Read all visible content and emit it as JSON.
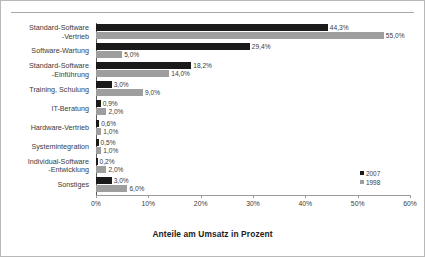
{
  "chart_data": {
    "type": "bar",
    "orientation": "horizontal",
    "title": "",
    "xlabel": "Anteile am Umsatz in Prozent",
    "ylabel": "",
    "xlim": [
      0,
      60
    ],
    "xticks": [
      "0%",
      "10%",
      "20%",
      "30%",
      "40%",
      "50%",
      "60%"
    ],
    "xtick_values": [
      0,
      10,
      20,
      30,
      40,
      50,
      60
    ],
    "grid": false,
    "legend_position": "bottom-right",
    "categories": [
      "Standard-Software\n-Vertrieb",
      "Software-Wartung",
      "Standard-Software\n-Einführung",
      "Training, Schulung",
      "IT-Beratung",
      "Hardware-Vertrieb",
      "Systemintegration",
      "Individual-Software\n-Entwicklung",
      "Sonstiges"
    ],
    "series": [
      {
        "name": "2007",
        "color": "#1a1a1a",
        "values": [
          44.3,
          29.4,
          18.2,
          3.0,
          0.9,
          0.6,
          0.5,
          0.2,
          3.0
        ],
        "labels": [
          "44,3%",
          "29,4%",
          "18,2%",
          "3,0%",
          "0,9%",
          "0,6%",
          "0,5%",
          "0,2%",
          "3,0%"
        ]
      },
      {
        "name": "1998",
        "color": "#9e9e9e",
        "values": [
          55.0,
          5.0,
          14.0,
          9.0,
          2.0,
          1.0,
          1.0,
          2.0,
          6.0
        ],
        "labels": [
          "55,0%",
          "5,0%",
          "14,0%",
          "9,0%",
          "2,0%",
          "1,0%",
          "1,0%",
          "2,0%",
          "6,0%"
        ]
      }
    ]
  },
  "legend": {
    "items": [
      {
        "label": "2007",
        "color": "#1a1a1a"
      },
      {
        "label": "1998",
        "color": "#9e9e9e"
      }
    ]
  }
}
